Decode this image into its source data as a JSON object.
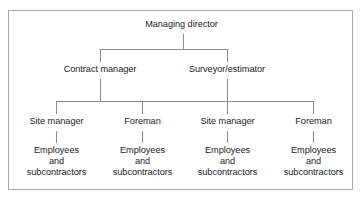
{
  "diagram": {
    "title_text": "",
    "line_color": "#8c8c8c",
    "border_color": "#a8a8a8",
    "text_color": "#1c1c1c",
    "background": "#ffffff",
    "type": "organizational-hierarchy",
    "levels": 4
  },
  "nodes": {
    "root": {
      "label": "Managing director"
    },
    "level2": [
      {
        "label": "Contract manager"
      },
      {
        "label": "Surveyor/estimator"
      }
    ],
    "level3": [
      {
        "label": "Site manager"
      },
      {
        "label": "Foreman"
      },
      {
        "label": "Site manager"
      },
      {
        "label": "Foreman"
      }
    ],
    "level4": [
      {
        "line1": "Employees",
        "line2": "and",
        "line3": "subcontractors"
      },
      {
        "line1": "Employees",
        "line2": "and",
        "line3": "subcontractors"
      },
      {
        "line1": "Employees",
        "line2": "and",
        "line3": "subcontractors"
      },
      {
        "line1": "Employees",
        "line2": "and",
        "line3": "subcontractors"
      }
    ]
  }
}
